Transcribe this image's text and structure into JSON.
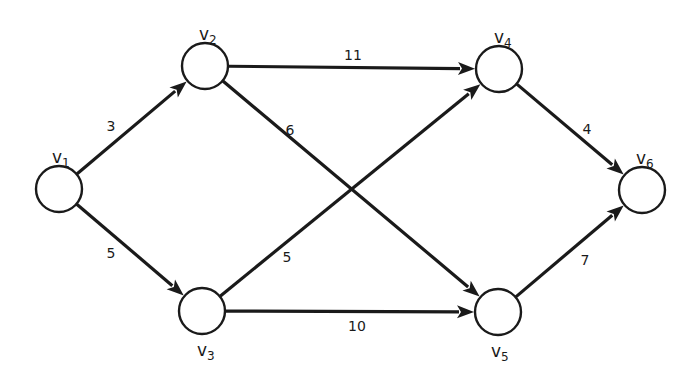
{
  "diagram": {
    "type": "directed-weighted-graph",
    "colors": {
      "stroke": "#1a1a1a",
      "node_fill": "#ffffff",
      "background": "#ffffff"
    },
    "node_radius": 23,
    "nodes": [
      {
        "id": "v1",
        "letter": "v",
        "sub": "1",
        "x": 59,
        "y": 189,
        "label_x": 52,
        "label_y": 163
      },
      {
        "id": "v2",
        "letter": "v",
        "sub": "2",
        "x": 205,
        "y": 66,
        "label_x": 199,
        "label_y": 40
      },
      {
        "id": "v3",
        "letter": "v",
        "sub": "3",
        "x": 202,
        "y": 311,
        "label_x": 197,
        "label_y": 356
      },
      {
        "id": "v4",
        "letter": "v",
        "sub": "4",
        "x": 499,
        "y": 69,
        "label_x": 494,
        "label_y": 43
      },
      {
        "id": "v5",
        "letter": "v",
        "sub": "5",
        "x": 498,
        "y": 312,
        "label_x": 491,
        "label_y": 357
      },
      {
        "id": "v6",
        "letter": "v",
        "sub": "6",
        "x": 642,
        "y": 190,
        "label_x": 636,
        "label_y": 164
      }
    ],
    "edges": [
      {
        "from": "v1",
        "to": "v2",
        "weight": "3",
        "label_x": 111,
        "label_y": 131
      },
      {
        "from": "v1",
        "to": "v3",
        "weight": "5",
        "label_x": 111,
        "label_y": 258
      },
      {
        "from": "v2",
        "to": "v4",
        "weight": "11",
        "label_x": 353,
        "label_y": 60
      },
      {
        "from": "v2",
        "to": "v5",
        "weight": "6",
        "label_x": 290,
        "label_y": 135
      },
      {
        "from": "v3",
        "to": "v4",
        "weight": "5",
        "label_x": 287,
        "label_y": 262
      },
      {
        "from": "v3",
        "to": "v5",
        "weight": "10",
        "label_x": 357,
        "label_y": 331
      },
      {
        "from": "v4",
        "to": "v6",
        "weight": "4",
        "label_x": 587,
        "label_y": 134
      },
      {
        "from": "v5",
        "to": "v6",
        "weight": "7",
        "label_x": 585,
        "label_y": 265
      }
    ]
  }
}
